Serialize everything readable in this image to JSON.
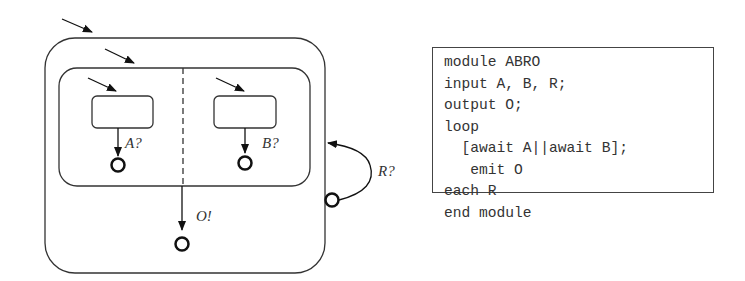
{
  "diagram": {
    "labels": {
      "left_trigger": "A?",
      "right_trigger": "B?",
      "emit": "O!",
      "reset": "R?"
    },
    "states": [
      "outer-macrostate",
      "parallel-macrostate",
      "region-a-wait-state",
      "region-b-wait-state"
    ]
  },
  "code": {
    "lines": [
      "module ABRO",
      "input A, B, R;",
      "output O;",
      "loop",
      "  [await A||await B];",
      "   emit O",
      "each R",
      "end module"
    ]
  }
}
